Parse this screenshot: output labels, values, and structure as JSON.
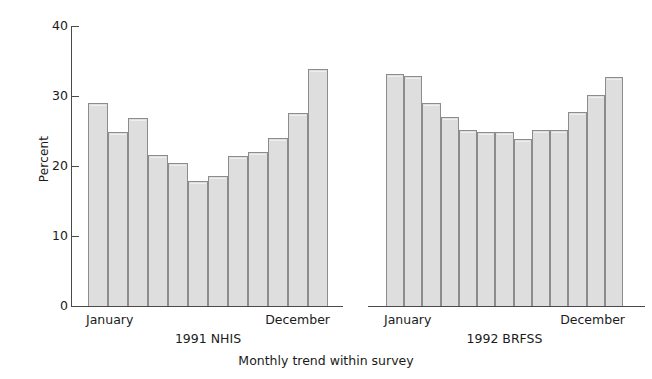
{
  "chart_data": {
    "type": "bar",
    "title": "",
    "subtitle": "",
    "xlabel": "Monthly trend within survey",
    "ylabel": "Percent",
    "ylim": [
      0,
      40
    ],
    "yticks": [
      0,
      10,
      20,
      30,
      40
    ],
    "ytick_labels": [
      "0",
      "10",
      "20",
      "30",
      "40"
    ],
    "grid": false,
    "legend": "none",
    "bar_fill_color": "#dedede",
    "bar_edge_color": "#8c8c8c",
    "axis_color": "#4a4a4a",
    "groups": [
      {
        "name": "1991 NHIS",
        "caption": "1991 NHIS",
        "start_label": "January",
        "end_label": "December",
        "categories": [
          "January",
          "February",
          "March",
          "April",
          "May",
          "June",
          "July",
          "August",
          "September",
          "October",
          "November",
          "December"
        ],
        "values": [
          29.0,
          24.9,
          26.9,
          21.6,
          20.4,
          17.9,
          18.6,
          21.4,
          22.0,
          24.0,
          27.6,
          33.9
        ]
      },
      {
        "name": "1992 BRFSS",
        "caption": "1992 BRFSS",
        "start_label": "January",
        "end_label": "December",
        "categories": [
          "January",
          "February",
          "March",
          "April",
          "May",
          "June",
          "July",
          "August",
          "September",
          "October",
          "November",
          "December"
        ],
        "values": [
          33.2,
          32.9,
          29.0,
          27.0,
          25.2,
          24.9,
          24.9,
          23.9,
          25.1,
          25.2,
          27.7,
          30.2,
          32.7
        ]
      }
    ]
  },
  "axes": {
    "y_label": "Percent",
    "x_label": "Monthly trend within survey",
    "y_ticks": [
      {
        "label": "40",
        "value": 40
      },
      {
        "label": "30",
        "value": 30
      },
      {
        "label": "20",
        "value": 20
      },
      {
        "label": "10",
        "value": 10
      },
      {
        "label": "0",
        "value": 0
      }
    ]
  },
  "groups": {
    "nhis": {
      "caption": "1991 NHIS",
      "start_label": "January",
      "end_label": "December"
    },
    "brfss": {
      "caption": "1992 BRFSS",
      "start_label": "January",
      "end_label": "December"
    }
  }
}
